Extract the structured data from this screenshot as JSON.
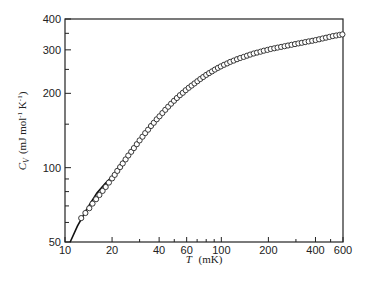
{
  "chart_data": {
    "type": "scatter",
    "title": "",
    "xlabel": "T (mK)",
    "xlabel_var": "T",
    "xlabel_unit": "(mK)",
    "ylabel": "C_V (mJ mol^-1 K^-1)",
    "ylabel_var": "C",
    "ylabel_sub": "V",
    "ylabel_unit": "(mJ mol",
    "ylabel_unit_exp1": "-1",
    "ylabel_unit_mid": " K",
    "ylabel_unit_exp2": "-1",
    "ylabel_unit_end": ")",
    "xscale": "log",
    "yscale": "log",
    "xlim": [
      10,
      600
    ],
    "ylim": [
      50,
      400
    ],
    "grid": false,
    "legend": null,
    "x_ticks": [
      10,
      20,
      40,
      60,
      100,
      200,
      400,
      600
    ],
    "x_tick_labels": [
      "10",
      "20",
      "40",
      "60",
      "100",
      "200",
      "400",
      "600"
    ],
    "x_minor_ticks": [
      30,
      50,
      70,
      80,
      90,
      300,
      500
    ],
    "y_ticks": [
      50,
      100,
      200,
      300,
      400
    ],
    "y_tick_labels": [
      "50",
      "100",
      "200",
      "300",
      "400"
    ],
    "y_minor_ticks": [
      60,
      70,
      80,
      90,
      150,
      250,
      350
    ],
    "series": [
      {
        "name": "measured",
        "style": "open-circles",
        "x": [
          12.7,
          13.5,
          14.3,
          15.0,
          15.8,
          16.6,
          17.4,
          18.2,
          19.1,
          20.0,
          20.8,
          21.6,
          22.5,
          23.4,
          24.4,
          25.4,
          26.5,
          27.6,
          28.8,
          30.0,
          31.3,
          32.6,
          34.0,
          35.5,
          37.0,
          38.6,
          40.2,
          42.0,
          43.8,
          45.7,
          47.7,
          49.8,
          52.0,
          54.3,
          56.7,
          59.2,
          61.8,
          64.5,
          67.3,
          70.3,
          73.4,
          76.6,
          80.0,
          83.5,
          87.2,
          91.0,
          95.0,
          99.2,
          104,
          109,
          114,
          120,
          126,
          132,
          139,
          146,
          153,
          161,
          169,
          178,
          187,
          197,
          207,
          218,
          229,
          241,
          254,
          267,
          281,
          296,
          311,
          327,
          344,
          362,
          381,
          401,
          422,
          444,
          467,
          491,
          516,
          543,
          571,
          595
        ],
        "y": [
          62.5,
          65.5,
          68.5,
          71.5,
          74.5,
          77.5,
          80.5,
          83.5,
          87.0,
          90.5,
          93.5,
          97.0,
          100.5,
          104.0,
          108.0,
          112.0,
          116.0,
          120.0,
          124.5,
          129.0,
          133.5,
          138.0,
          142.5,
          147.5,
          152.0,
          157.0,
          161.5,
          166.5,
          171.5,
          176.5,
          181.5,
          186.5,
          191.5,
          196.5,
          201.0,
          206.0,
          210.5,
          215.0,
          219.5,
          224.0,
          228.5,
          233.0,
          237.5,
          241.5,
          245.5,
          249.5,
          253.5,
          257.0,
          261.0,
          264.5,
          268.0,
          271.5,
          275.0,
          278.0,
          281.0,
          284.0,
          287.0,
          290.0,
          292.5,
          295.0,
          297.5,
          300.0,
          302.5,
          304.5,
          306.5,
          308.5,
          310.5,
          312.5,
          314.5,
          316.5,
          318.5,
          320.5,
          322.5,
          324.5,
          326.5,
          328.5,
          331.0,
          333.5,
          336.0,
          338.5,
          341.0,
          343.0,
          345.0,
          346.5
        ]
      },
      {
        "name": "fit",
        "style": "solid-line",
        "x": [
          10.8,
          12,
          14,
          16,
          18,
          20,
          25,
          30,
          35,
          40,
          50,
          60,
          70,
          80,
          100,
          120,
          150,
          200,
          250,
          300,
          400,
          500,
          600
        ],
        "y": [
          50,
          58,
          69,
          79,
          86,
          92,
          112,
          129,
          147,
          161,
          186,
          206,
          222,
          236,
          257,
          272,
          287,
          303,
          313,
          320,
          333,
          340,
          347
        ]
      }
    ]
  }
}
